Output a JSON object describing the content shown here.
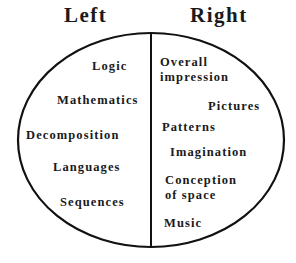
{
  "diagram": {
    "type": "brain-hemisphere-diagram",
    "shape": "ellipse divided vertically",
    "colors": {
      "line": "#111111",
      "text": "#1a1a1a",
      "background": "#ffffff"
    },
    "left": {
      "heading": "Left",
      "items": [
        "Logic",
        "Mathematics",
        "Decomposition",
        "Languages",
        "Sequences"
      ]
    },
    "right": {
      "heading": "Right",
      "items": [
        "Overall impression",
        "Pictures",
        "Patterns",
        "Imagination",
        "Conception of space",
        "Music"
      ],
      "item_lines": {
        "overall_1": "Overall",
        "overall_2": "impression",
        "conception_1": "Conception",
        "conception_2": "of space"
      }
    }
  }
}
